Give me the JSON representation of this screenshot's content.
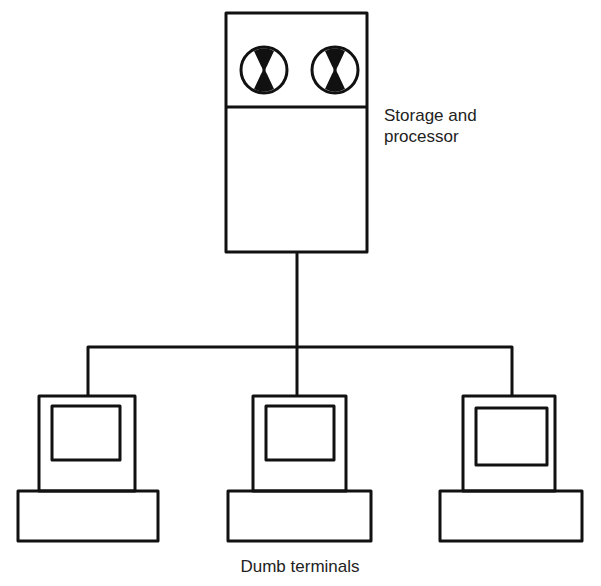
{
  "diagram": {
    "type": "network-topology",
    "server": {
      "label_line1": "Storage and",
      "label_line2": "processor",
      "disk_count": 2
    },
    "terminals": {
      "label": "Dumb terminals",
      "count": 3
    },
    "colors": {
      "stroke": "#111111",
      "background": "#ffffff"
    }
  }
}
